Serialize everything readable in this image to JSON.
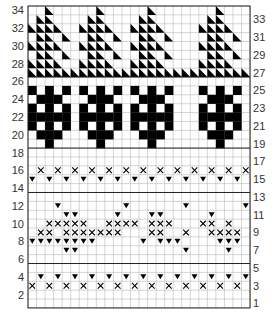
{
  "grid": {
    "cols": 26,
    "rows": 34,
    "x0": 28,
    "y0": 6,
    "cell_w": 8.54,
    "cell_h": 8.88
  },
  "colors": {
    "ink": "#000000",
    "grid": "#b8b8b8",
    "label": "#333333",
    "border": "#222222"
  },
  "left_labels": [
    34,
    32,
    30,
    28,
    26,
    24,
    22,
    20,
    18,
    16,
    14,
    12,
    10,
    8,
    6,
    4,
    2
  ],
  "right_labels": [
    33,
    31,
    29,
    27,
    25,
    23,
    21,
    19,
    17,
    15,
    13,
    11,
    9,
    7,
    5,
    3,
    1
  ],
  "band_separators": [
    26.5,
    18.5,
    13.5,
    5.5
  ],
  "symbols": {
    "filled": "solid black cell",
    "x": "cross stitch",
    "tri": "down-pointing triangle (bobble/purl)",
    "diag": "diagonal half-cell triangle"
  },
  "bands": {
    "triangles": {
      "rows": [
        27,
        28,
        29,
        30,
        31,
        32,
        33,
        34
      ],
      "motif_starts": [
        0,
        6,
        12,
        20
      ],
      "motif": [
        {
          "row": 34,
          "cols": [
            2
          ]
        },
        {
          "row": 33,
          "cols": [
            1,
            2
          ]
        },
        {
          "row": 32,
          "cols": [
            0,
            1,
            2,
            3
          ]
        },
        {
          "row": 31,
          "cols": [
            1,
            2,
            4
          ]
        },
        {
          "row": 30,
          "cols": [
            0,
            1,
            2,
            3
          ]
        },
        {
          "row": 29,
          "cols": [
            1,
            2,
            4
          ]
        },
        {
          "row": 28,
          "cols": [
            0,
            1,
            2,
            3
          ]
        },
        {
          "row": 27,
          "cols": [
            0,
            1,
            2,
            3,
            4,
            5
          ]
        }
      ],
      "row27_full": true
    },
    "trees": {
      "motif_starts": [
        0,
        6,
        12,
        20
      ],
      "motif": [
        {
          "row": 25,
          "cols": [
            0,
            2,
            4
          ]
        },
        {
          "row": 24,
          "cols": [
            1,
            2,
            3
          ]
        },
        {
          "row": 23,
          "cols": [
            0,
            2,
            4
          ]
        },
        {
          "row": 22,
          "cols": [
            0,
            1,
            2,
            3,
            4
          ]
        },
        {
          "row": 21,
          "cols": [
            0,
            2,
            4
          ]
        },
        {
          "row": 20,
          "cols": [
            1,
            2,
            3
          ]
        },
        {
          "row": 19,
          "cols": [
            2
          ]
        }
      ]
    },
    "zigzag_top": {
      "x_row": 16,
      "x_cols": [
        1,
        3,
        5,
        7,
        9,
        11,
        13,
        15,
        17,
        19,
        21,
        23,
        25
      ],
      "tri_row": 15,
      "tri_cols": [
        0,
        2,
        4,
        6,
        8,
        10,
        12,
        14,
        16,
        18,
        20,
        22,
        24
      ]
    },
    "middle_motif": {
      "tri": [
        {
          "row": 12,
          "cols": [
            3,
            11,
            18,
            25
          ]
        },
        {
          "row": 11,
          "cols": [
            4,
            5,
            10,
            14,
            15,
            21
          ]
        },
        {
          "row": 8,
          "cols": [
            0,
            1,
            2,
            3,
            4,
            5,
            6,
            7,
            13,
            15,
            16,
            17,
            22,
            23,
            24
          ]
        },
        {
          "row": 7,
          "cols": [
            4,
            5,
            18,
            23
          ]
        }
      ],
      "x": [
        {
          "row": 10,
          "cols": [
            2,
            3,
            4,
            5,
            6,
            9,
            10,
            11,
            12,
            14,
            15,
            16,
            20,
            21,
            23
          ]
        },
        {
          "row": 9,
          "cols": [
            1,
            2,
            4,
            5,
            6,
            7,
            8,
            9,
            10,
            14,
            15,
            18,
            21,
            22,
            23,
            24
          ]
        }
      ]
    },
    "zigzag_bottom": {
      "tri_row": 4,
      "tri_cols": [
        1,
        3,
        5,
        7,
        9,
        11,
        13,
        15,
        17,
        19,
        21,
        23,
        25
      ],
      "x_row": 3,
      "x_cols": [
        0,
        2,
        4,
        6,
        8,
        10,
        12,
        14,
        16,
        18,
        20,
        22,
        24
      ]
    }
  }
}
